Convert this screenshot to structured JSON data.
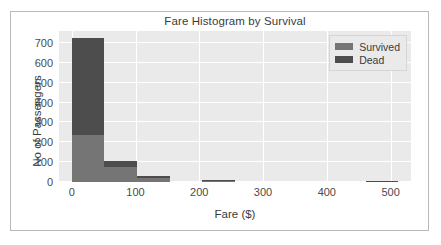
{
  "chart_data": {
    "type": "bar",
    "title": "Fare Histogram by Survival",
    "xlabel": "Fare ($)",
    "ylabel": "No of Passengers",
    "xlim": [
      -20,
      532
    ],
    "ylim": [
      0,
      760
    ],
    "xticks": [
      0,
      100,
      200,
      300,
      400,
      500
    ],
    "yticks": [
      0,
      100,
      200,
      300,
      400,
      500,
      600,
      700
    ],
    "grid": true,
    "legend_position": "upper right",
    "stacked": true,
    "bin_width": 51.2,
    "bin_edges": [
      0,
      51.2,
      102.4,
      153.6,
      204.8,
      256,
      307.2,
      358.4,
      409.6,
      460.8,
      512
    ],
    "series": [
      {
        "name": "Survived",
        "color": "#757575",
        "values": [
          235,
          75,
          21,
          0,
          4,
          0,
          0,
          0,
          0,
          2
        ]
      },
      {
        "name": "Dead",
        "color": "#4d4d4d",
        "values": [
          490,
          33,
          10,
          0,
          2,
          0,
          0,
          0,
          0,
          1
        ]
      }
    ],
    "totals": [
      725,
      108,
      31,
      0,
      6,
      0,
      0,
      0,
      0,
      3
    ]
  },
  "legend": {
    "items": [
      {
        "label": "Survived",
        "color": "#757575"
      },
      {
        "label": "Dead",
        "color": "#4d4d4d"
      }
    ]
  },
  "style": {
    "figure_background": "#ffffff",
    "axes_background": "#eaeaea",
    "gridline_color": "#ffffff",
    "text_color": "#3b3b3b",
    "border_color": "#b9b9b9"
  }
}
